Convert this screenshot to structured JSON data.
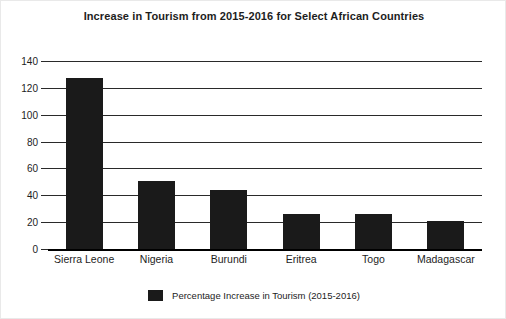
{
  "chart_data": {
    "type": "bar",
    "title": "Increase in Tourism from 2015-2016 for Select African Countries",
    "xlabel": "",
    "ylabel": "",
    "categories": [
      "Sierra Leone",
      "Nigeria",
      "Burundi",
      "Eritrea",
      "Togo",
      "Madagascar"
    ],
    "values": [
      127,
      51,
      44,
      26,
      26,
      21
    ],
    "series": [
      {
        "name": "Percentage Increase in Tourism (2015-2016)",
        "values": [
          127,
          51,
          44,
          26,
          26,
          21
        ]
      }
    ],
    "ylim": [
      0,
      140
    ],
    "yticks": [
      0,
      20,
      40,
      60,
      80,
      100,
      120,
      140
    ],
    "ytick_labels": [
      "0",
      "20",
      "40",
      "60",
      "80",
      "100",
      "120",
      "140"
    ],
    "grid": true,
    "legend_position": "bottom",
    "bar_color": "#1a1a1a"
  },
  "legend": {
    "entries": [
      {
        "label": "Percentage Increase in Tourism (2015-2016)",
        "color": "#1a1a1a"
      }
    ]
  }
}
